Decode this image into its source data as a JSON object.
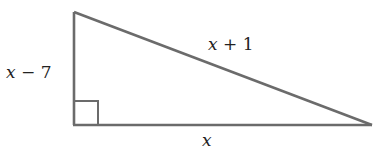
{
  "diagram": {
    "type": "right-triangle",
    "stroke_color": "#6b6b6b",
    "label_color": "#222222",
    "vertices": {
      "top": [
        74,
        12
      ],
      "right_angle": [
        74,
        125
      ],
      "right": [
        372,
        125
      ]
    },
    "right_angle_marker": {
      "corner": [
        74,
        125
      ],
      "size": 24
    },
    "labels": {
      "vertical_leg": {
        "var": "x",
        "rest": " − 7"
      },
      "hypotenuse": {
        "var": "x",
        "rest": " + 1"
      },
      "horizontal_leg": {
        "var": "x",
        "rest": ""
      }
    }
  }
}
